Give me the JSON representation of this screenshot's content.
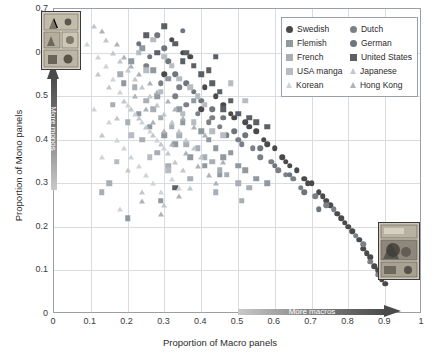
{
  "chart_data": {
    "type": "scatter",
    "title": "",
    "xlabel": "Proportion of Macro panels",
    "ylabel": "Proportion of Mono panels",
    "xlim": [
      0,
      1
    ],
    "ylim": [
      0,
      0.7
    ],
    "xticks": [
      "0",
      "0.1",
      "0.2",
      "0.3",
      "0.4",
      "0.5",
      "0.6",
      "0.7",
      "0.8",
      "0.9",
      "1"
    ],
    "xtick_values": [
      0,
      0.1,
      0.2,
      0.3,
      0.4,
      0.5,
      0.6,
      0.7,
      0.8,
      0.9,
      1
    ],
    "yticks": [
      "0",
      "0.1",
      "0.2",
      "0.3",
      "0.4",
      "0.5",
      "0.6",
      "0.7"
    ],
    "ytick_values": [
      0,
      0.1,
      0.2,
      0.3,
      0.4,
      0.5,
      0.6,
      0.7
    ],
    "grid": true,
    "legend_position": "top-right",
    "annotations": [
      {
        "name": "more-macros-arrow",
        "text": "More macros",
        "direction": "right"
      },
      {
        "name": "more-monos-arrow",
        "text": "More monos",
        "direction": "up"
      }
    ],
    "series": [
      {
        "name": "Swedish",
        "marker": "circle",
        "color": "#4a4a4a",
        "points": [
          [
            0.32,
            0.63
          ],
          [
            0.35,
            0.6
          ],
          [
            0.3,
            0.55
          ],
          [
            0.37,
            0.59
          ],
          [
            0.41,
            0.52
          ],
          [
            0.44,
            0.5
          ],
          [
            0.4,
            0.47
          ],
          [
            0.46,
            0.48
          ],
          [
            0.49,
            0.45
          ],
          [
            0.52,
            0.44
          ],
          [
            0.55,
            0.42
          ],
          [
            0.57,
            0.4
          ],
          [
            0.6,
            0.38
          ],
          [
            0.62,
            0.36
          ],
          [
            0.64,
            0.34
          ],
          [
            0.66,
            0.33
          ],
          [
            0.68,
            0.31
          ],
          [
            0.7,
            0.3
          ],
          [
            0.72,
            0.28
          ],
          [
            0.74,
            0.26
          ],
          [
            0.75,
            0.25
          ],
          [
            0.77,
            0.23
          ],
          [
            0.78,
            0.22
          ],
          [
            0.8,
            0.2
          ],
          [
            0.81,
            0.19
          ],
          [
            0.83,
            0.17
          ],
          [
            0.84,
            0.15
          ],
          [
            0.86,
            0.13
          ],
          [
            0.87,
            0.11
          ],
          [
            0.88,
            0.1
          ],
          [
            0.89,
            0.08
          ],
          [
            0.9,
            0.07
          ],
          [
            0.58,
            0.39
          ],
          [
            0.63,
            0.35
          ],
          [
            0.69,
            0.3
          ],
          [
            0.73,
            0.27
          ],
          [
            0.79,
            0.21
          ],
          [
            0.85,
            0.14
          ],
          [
            0.53,
            0.43
          ],
          [
            0.48,
            0.46
          ]
        ]
      },
      {
        "name": "Dutch",
        "marker": "circle",
        "color": "#7b7f86",
        "points": [
          [
            0.25,
            0.57
          ],
          [
            0.29,
            0.53
          ],
          [
            0.33,
            0.5
          ],
          [
            0.36,
            0.48
          ],
          [
            0.39,
            0.46
          ],
          [
            0.42,
            0.44
          ],
          [
            0.45,
            0.43
          ],
          [
            0.47,
            0.41
          ],
          [
            0.5,
            0.4
          ],
          [
            0.54,
            0.38
          ],
          [
            0.56,
            0.36
          ],
          [
            0.59,
            0.35
          ],
          [
            0.61,
            0.33
          ],
          [
            0.65,
            0.31
          ],
          [
            0.67,
            0.29
          ],
          [
            0.71,
            0.27
          ],
          [
            0.76,
            0.24
          ],
          [
            0.82,
            0.18
          ],
          [
            0.84,
            0.16
          ],
          [
            0.86,
            0.12
          ],
          [
            0.34,
            0.52
          ],
          [
            0.43,
            0.45
          ],
          [
            0.51,
            0.39
          ],
          [
            0.63,
            0.32
          ],
          [
            0.74,
            0.25
          ],
          [
            0.88,
            0.09
          ]
        ]
      },
      {
        "name": "Flemish",
        "marker": "square",
        "color": "#9098a0",
        "points": [
          [
            0.21,
            0.58
          ],
          [
            0.24,
            0.61
          ],
          [
            0.27,
            0.56
          ],
          [
            0.28,
            0.5
          ],
          [
            0.31,
            0.54
          ],
          [
            0.34,
            0.47
          ],
          [
            0.35,
            0.44
          ],
          [
            0.38,
            0.49
          ],
          [
            0.4,
            0.42
          ],
          [
            0.42,
            0.4
          ],
          [
            0.44,
            0.38
          ],
          [
            0.46,
            0.36
          ],
          [
            0.48,
            0.37
          ],
          [
            0.5,
            0.34
          ],
          [
            0.19,
            0.53
          ],
          [
            0.23,
            0.46
          ],
          [
            0.26,
            0.43
          ],
          [
            0.3,
            0.41
          ],
          [
            0.33,
            0.39
          ],
          [
            0.37,
            0.36
          ],
          [
            0.41,
            0.34
          ],
          [
            0.45,
            0.32
          ],
          [
            0.52,
            0.33
          ],
          [
            0.55,
            0.31
          ],
          [
            0.58,
            0.3
          ],
          [
            0.2,
            0.22
          ],
          [
            0.29,
            0.26
          ]
        ]
      },
      {
        "name": "German",
        "marker": "circle",
        "color": "#6f757c",
        "points": [
          [
            0.23,
            0.62
          ],
          [
            0.26,
            0.59
          ],
          [
            0.28,
            0.64
          ],
          [
            0.31,
            0.58
          ],
          [
            0.33,
            0.55
          ],
          [
            0.36,
            0.53
          ],
          [
            0.38,
            0.51
          ],
          [
            0.4,
            0.49
          ],
          [
            0.43,
            0.47
          ],
          [
            0.46,
            0.45
          ],
          [
            0.49,
            0.42
          ],
          [
            0.52,
            0.41
          ],
          [
            0.56,
            0.38
          ],
          [
            0.6,
            0.34
          ],
          [
            0.64,
            0.32
          ],
          [
            0.68,
            0.28
          ],
          [
            0.72,
            0.24
          ],
          [
            0.35,
            0.65
          ],
          [
            0.3,
            0.61
          ]
        ]
      },
      {
        "name": "French",
        "marker": "square",
        "color": "#a8aeb5",
        "points": [
          [
            0.18,
            0.55
          ],
          [
            0.22,
            0.52
          ],
          [
            0.25,
            0.49
          ],
          [
            0.27,
            0.47
          ],
          [
            0.29,
            0.45
          ],
          [
            0.32,
            0.43
          ],
          [
            0.34,
            0.41
          ],
          [
            0.36,
            0.39
          ],
          [
            0.39,
            0.38
          ],
          [
            0.41,
            0.36
          ],
          [
            0.43,
            0.35
          ],
          [
            0.45,
            0.33
          ],
          [
            0.47,
            0.32
          ],
          [
            0.5,
            0.3
          ],
          [
            0.53,
            0.29
          ],
          [
            0.16,
            0.48
          ],
          [
            0.2,
            0.44
          ],
          [
            0.24,
            0.4
          ],
          [
            0.28,
            0.37
          ],
          [
            0.31,
            0.34
          ],
          [
            0.37,
            0.31
          ],
          [
            0.44,
            0.28
          ],
          [
            0.51,
            0.26
          ],
          [
            0.13,
            0.28
          ],
          [
            0.15,
            0.3
          ]
        ]
      },
      {
        "name": "United States",
        "marker": "square",
        "color": "#5b6066",
        "points": [
          [
            0.3,
            0.66
          ],
          [
            0.33,
            0.62
          ],
          [
            0.36,
            0.6
          ],
          [
            0.38,
            0.57
          ],
          [
            0.4,
            0.55
          ],
          [
            0.43,
            0.53
          ],
          [
            0.45,
            0.51
          ],
          [
            0.48,
            0.49
          ],
          [
            0.35,
            0.58
          ],
          [
            0.42,
            0.56
          ],
          [
            0.46,
            0.47
          ],
          [
            0.5,
            0.46
          ],
          [
            0.53,
            0.45
          ],
          [
            0.25,
            0.64
          ],
          [
            0.28,
            0.6
          ],
          [
            0.44,
            0.59
          ],
          [
            0.55,
            0.44
          ],
          [
            0.58,
            0.43
          ],
          [
            0.33,
            0.29
          ]
        ]
      },
      {
        "name": "USA manga",
        "marker": "square",
        "color": "#b7bcc2",
        "points": [
          [
            0.27,
            0.63
          ],
          [
            0.3,
            0.59
          ],
          [
            0.32,
            0.57
          ],
          [
            0.34,
            0.54
          ],
          [
            0.37,
            0.52
          ],
          [
            0.39,
            0.5
          ],
          [
            0.41,
            0.48
          ],
          [
            0.23,
            0.6
          ],
          [
            0.25,
            0.56
          ],
          [
            0.29,
            0.51
          ],
          [
            0.35,
            0.46
          ],
          [
            0.38,
            0.44
          ],
          [
            0.43,
            0.42
          ],
          [
            0.46,
            0.41
          ],
          [
            0.21,
            0.41
          ],
          [
            0.26,
            0.36
          ],
          [
            0.31,
            0.33
          ],
          [
            0.17,
            0.35
          ],
          [
            0.48,
            0.53
          ],
          [
            0.52,
            0.49
          ]
        ]
      },
      {
        "name": "Japanese",
        "marker": "triangle",
        "color": "#c2c7cd",
        "points": [
          [
            0.11,
            0.66
          ],
          [
            0.14,
            0.63
          ],
          [
            0.16,
            0.6
          ],
          [
            0.18,
            0.58
          ],
          [
            0.2,
            0.56
          ],
          [
            0.22,
            0.54
          ],
          [
            0.24,
            0.52
          ],
          [
            0.26,
            0.5
          ],
          [
            0.28,
            0.48
          ],
          [
            0.3,
            0.46
          ],
          [
            0.32,
            0.44
          ],
          [
            0.34,
            0.42
          ],
          [
            0.36,
            0.4
          ],
          [
            0.19,
            0.49
          ],
          [
            0.21,
            0.47
          ],
          [
            0.23,
            0.45
          ],
          [
            0.25,
            0.43
          ],
          [
            0.27,
            0.41
          ],
          [
            0.29,
            0.39
          ],
          [
            0.31,
            0.37
          ],
          [
            0.33,
            0.35
          ],
          [
            0.35,
            0.33
          ],
          [
            0.12,
            0.55
          ],
          [
            0.15,
            0.52
          ],
          [
            0.17,
            0.45
          ],
          [
            0.13,
            0.41
          ],
          [
            0.38,
            0.38
          ],
          [
            0.4,
            0.36
          ],
          [
            0.37,
            0.29
          ],
          [
            0.3,
            0.25
          ],
          [
            0.24,
            0.28
          ],
          [
            0.2,
            0.33
          ]
        ]
      },
      {
        "name": "Korean",
        "marker": "triangle",
        "color": "#cfd3d8",
        "points": [
          [
            0.09,
            0.62
          ],
          [
            0.12,
            0.59
          ],
          [
            0.14,
            0.57
          ],
          [
            0.16,
            0.54
          ],
          [
            0.18,
            0.51
          ],
          [
            0.2,
            0.48
          ],
          [
            0.22,
            0.46
          ],
          [
            0.24,
            0.44
          ],
          [
            0.26,
            0.42
          ],
          [
            0.28,
            0.4
          ],
          [
            0.3,
            0.38
          ],
          [
            0.15,
            0.44
          ],
          [
            0.17,
            0.4
          ],
          [
            0.19,
            0.38
          ],
          [
            0.21,
            0.36
          ],
          [
            0.23,
            0.34
          ],
          [
            0.25,
            0.32
          ],
          [
            0.27,
            0.3
          ],
          [
            0.29,
            0.28
          ],
          [
            0.13,
            0.36
          ],
          [
            0.11,
            0.47
          ],
          [
            0.32,
            0.31
          ],
          [
            0.34,
            0.29
          ],
          [
            0.18,
            0.24
          ]
        ]
      },
      {
        "name": "Hong Kong",
        "marker": "triangle",
        "color": "#aeb3b9",
        "points": [
          [
            0.13,
            0.65
          ],
          [
            0.17,
            0.62
          ],
          [
            0.19,
            0.59
          ],
          [
            0.21,
            0.57
          ],
          [
            0.23,
            0.55
          ],
          [
            0.26,
            0.53
          ],
          [
            0.28,
            0.51
          ],
          [
            0.31,
            0.49
          ],
          [
            0.33,
            0.47
          ],
          [
            0.35,
            0.45
          ],
          [
            0.38,
            0.43
          ],
          [
            0.41,
            0.41
          ],
          [
            0.22,
            0.5
          ],
          [
            0.25,
            0.47
          ],
          [
            0.27,
            0.44
          ],
          [
            0.3,
            0.42
          ],
          [
            0.32,
            0.39
          ],
          [
            0.36,
            0.37
          ],
          [
            0.39,
            0.34
          ],
          [
            0.42,
            0.32
          ],
          [
            0.44,
            0.3
          ],
          [
            0.34,
            0.27
          ],
          [
            0.29,
            0.23
          ],
          [
            0.24,
            0.26
          ],
          [
            0.46,
            0.35
          ]
        ]
      }
    ]
  },
  "legend": {
    "entries": [
      {
        "label": "Swedish",
        "marker": "circle",
        "color": "#4a4a4a"
      },
      {
        "label": "Dutch",
        "marker": "circle",
        "color": "#7b7f86"
      },
      {
        "label": "Flemish",
        "marker": "square",
        "color": "#9098a0"
      },
      {
        "label": "German",
        "marker": "circle",
        "color": "#6f757c"
      },
      {
        "label": "French",
        "marker": "square",
        "color": "#a8aeb5"
      },
      {
        "label": "United States",
        "marker": "square",
        "color": "#5b6066"
      },
      {
        "label": "USA manga",
        "marker": "square",
        "color": "#b7bcc2"
      },
      {
        "label": "Japanese",
        "marker": "triangle",
        "color": "#c2c7cd"
      },
      {
        "label": "Korean",
        "marker": "triangle",
        "color": "#cfd3d8"
      },
      {
        "label": "Hong Kong",
        "marker": "triangle",
        "color": "#aeb3b9"
      }
    ]
  },
  "thumbnails": [
    {
      "name": "comic-page-mono-example",
      "position": "top-left"
    },
    {
      "name": "comic-page-macro-example",
      "position": "bottom-right"
    }
  ]
}
